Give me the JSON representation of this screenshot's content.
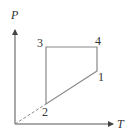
{
  "diagram": {
    "type": "thermodynamic-cycle",
    "axes": {
      "y_label": "P",
      "x_label": "T"
    },
    "points": [
      {
        "id": "1",
        "label": "1"
      },
      {
        "id": "2",
        "label": "2"
      },
      {
        "id": "3",
        "label": "3"
      },
      {
        "id": "4",
        "label": "4"
      }
    ],
    "path_order": [
      "1",
      "2",
      "3",
      "4",
      "1"
    ],
    "extension": {
      "from": "origin",
      "to": "2",
      "style": "dashed"
    },
    "colors": {
      "axis": "#444444",
      "cycle_line": "#888888",
      "dashed_line": "#888888",
      "text": "#333333"
    }
  }
}
